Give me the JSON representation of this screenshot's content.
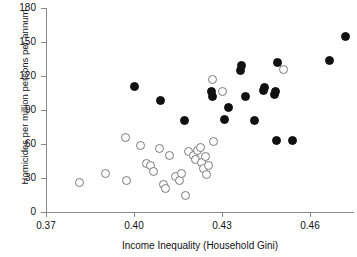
{
  "chart_data": {
    "type": "scatter",
    "title": "",
    "xlabel": "Income Inequality (Household Gini)",
    "ylabel": "Homicides per million persons per annum",
    "xlim": [
      0.37,
      0.475
    ],
    "ylim": [
      0,
      180
    ],
    "xticks": [
      0.37,
      0.4,
      0.43,
      0.46
    ],
    "xtick_labels": [
      "0.37",
      "0.40",
      "0.43",
      "0.46"
    ],
    "yticks": [
      0,
      30,
      60,
      90,
      120,
      150,
      180
    ],
    "ytick_labels": [
      "0",
      "30",
      "60",
      "90",
      "120",
      "150",
      "180"
    ],
    "grid": false,
    "legend": "none",
    "series": [
      {
        "name": "open-circles",
        "marker": "open-circle",
        "color": "#7a7a7a",
        "points": [
          {
            "x": 0.3814,
            "y": 26
          },
          {
            "x": 0.3902,
            "y": 34
          },
          {
            "x": 0.3971,
            "y": 66
          },
          {
            "x": 0.3975,
            "y": 28
          },
          {
            "x": 0.4021,
            "y": 59
          },
          {
            "x": 0.4043,
            "y": 43
          },
          {
            "x": 0.4057,
            "y": 41
          },
          {
            "x": 0.4068,
            "y": 36
          },
          {
            "x": 0.4086,
            "y": 56
          },
          {
            "x": 0.41,
            "y": 24
          },
          {
            "x": 0.4107,
            "y": 21
          },
          {
            "x": 0.4121,
            "y": 50
          },
          {
            "x": 0.4143,
            "y": 31
          },
          {
            "x": 0.4154,
            "y": 28
          },
          {
            "x": 0.4161,
            "y": 34
          },
          {
            "x": 0.4175,
            "y": 15
          },
          {
            "x": 0.4186,
            "y": 53
          },
          {
            "x": 0.4204,
            "y": 50
          },
          {
            "x": 0.4211,
            "y": 46
          },
          {
            "x": 0.4218,
            "y": 54
          },
          {
            "x": 0.4225,
            "y": 57
          },
          {
            "x": 0.4229,
            "y": 44
          },
          {
            "x": 0.4236,
            "y": 38
          },
          {
            "x": 0.4243,
            "y": 49
          },
          {
            "x": 0.4247,
            "y": 33
          },
          {
            "x": 0.4254,
            "y": 41
          },
          {
            "x": 0.4268,
            "y": 117
          },
          {
            "x": 0.4271,
            "y": 62
          },
          {
            "x": 0.43,
            "y": 106
          },
          {
            "x": 0.4511,
            "y": 126
          }
        ]
      },
      {
        "name": "filled-circles",
        "marker": "filled-circle",
        "color": "#111111",
        "points": [
          {
            "x": 0.4,
            "y": 111
          },
          {
            "x": 0.4089,
            "y": 98
          },
          {
            "x": 0.4171,
            "y": 81
          },
          {
            "x": 0.4264,
            "y": 106
          },
          {
            "x": 0.4268,
            "y": 102
          },
          {
            "x": 0.4307,
            "y": 82
          },
          {
            "x": 0.4321,
            "y": 92
          },
          {
            "x": 0.4364,
            "y": 125
          },
          {
            "x": 0.4368,
            "y": 129
          },
          {
            "x": 0.4379,
            "y": 102
          },
          {
            "x": 0.4411,
            "y": 81
          },
          {
            "x": 0.4443,
            "y": 107
          },
          {
            "x": 0.4446,
            "y": 110
          },
          {
            "x": 0.4479,
            "y": 104
          },
          {
            "x": 0.4482,
            "y": 106
          },
          {
            "x": 0.4486,
            "y": 63
          },
          {
            "x": 0.4489,
            "y": 132
          },
          {
            "x": 0.4539,
            "y": 63
          },
          {
            "x": 0.4668,
            "y": 134
          },
          {
            "x": 0.4721,
            "y": 155
          }
        ]
      }
    ]
  }
}
